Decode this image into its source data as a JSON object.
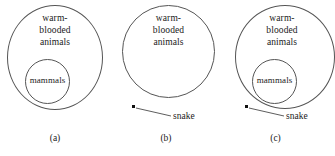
{
  "figure": {
    "type": "euler-diagram",
    "background_color": "#ffffff",
    "stroke_color": "#555555",
    "dot_color": "#111111",
    "panels": [
      {
        "caption": "(a)",
        "outer_set_label": "warm-\nblooded\nanimals",
        "inner_set_label": "mammals",
        "point_label": null
      },
      {
        "caption": "(b)",
        "outer_set_label": "warm-\nblooded\nanimals",
        "inner_set_label": null,
        "point_label": "snake"
      },
      {
        "caption": "(c)",
        "outer_set_label": "warm-\nblooded\nanimals",
        "inner_set_label": "mammals",
        "point_label": "snake"
      }
    ]
  }
}
